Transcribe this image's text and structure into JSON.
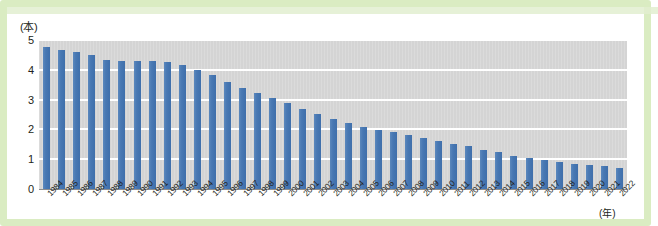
{
  "chart_data": {
    "type": "bar",
    "title": "",
    "subtitle": "",
    "xlabel": "(年)",
    "ylabel": "(本)",
    "ylim": [
      0,
      5
    ],
    "yticks": [
      0,
      1,
      2,
      3,
      4,
      5
    ],
    "ytick_labels": [
      "0",
      "1",
      "2",
      "3",
      "4",
      "5"
    ],
    "grid": true,
    "grid_color": "#ffffff",
    "legend": false,
    "legend_position": "none",
    "plot_background": "#d4d4d4",
    "bar_color": "#4b7cb5",
    "frame_color": "#daecc2",
    "categories": [
      "1984",
      "1985",
      "1986",
      "1987",
      "1988",
      "1989",
      "1990",
      "1991",
      "1992",
      "1993",
      "1994",
      "1995",
      "1996",
      "1997",
      "1998",
      "1999",
      "2000",
      "2001",
      "2002",
      "2003",
      "2004",
      "2005",
      "2006",
      "2007",
      "2008",
      "2009",
      "2010",
      "2011",
      "2012",
      "2013",
      "2014",
      "2015",
      "2016",
      "2017",
      "2018",
      "2019",
      "2020",
      "2021",
      "2022"
    ],
    "values": [
      4.78,
      4.66,
      4.6,
      4.5,
      4.34,
      4.3,
      4.3,
      4.3,
      4.25,
      4.15,
      4.0,
      3.82,
      3.6,
      3.4,
      3.22,
      3.05,
      2.88,
      2.7,
      2.52,
      2.35,
      2.22,
      2.08,
      1.98,
      1.92,
      1.8,
      1.7,
      1.6,
      1.52,
      1.45,
      1.32,
      1.25,
      1.12,
      1.05,
      0.98,
      0.92,
      0.85,
      0.8,
      0.78,
      0.72
    ]
  }
}
